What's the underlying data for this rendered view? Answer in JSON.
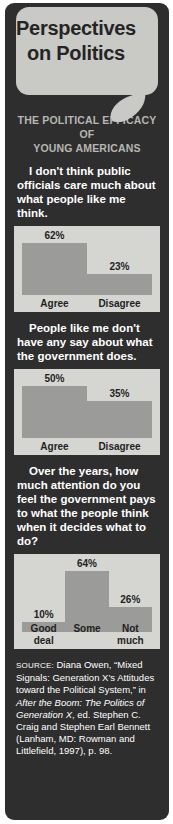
{
  "header": {
    "title_line1": "Perspectives",
    "title_line2": "on Politics",
    "bubble_color": "#c9c9c6",
    "background_color": "#2e2e2e"
  },
  "subtitle": {
    "line1": "THE POLITICAL EFFICACY OF",
    "line2": "YOUNG AMERICANS",
    "color": "#b6b6b2"
  },
  "chart_data": [
    {
      "type": "bar",
      "title": "I don't think public officials care much about what people like me think.",
      "categories": [
        "Agree",
        "Disagree"
      ],
      "values": [
        62,
        23
      ],
      "value_labels": [
        "62%",
        "23%"
      ],
      "ylim": [
        0,
        100
      ],
      "xlabel": "",
      "ylabel": "",
      "bar_color": "#9b9b99",
      "panel_color": "#d5d5d2"
    },
    {
      "type": "bar",
      "title": "People like me don't have any say about what the government does.",
      "categories": [
        "Agree",
        "Disagree"
      ],
      "values": [
        50,
        35
      ],
      "value_labels": [
        "50%",
        "35%"
      ],
      "ylim": [
        0,
        100
      ],
      "xlabel": "",
      "ylabel": "",
      "bar_color": "#9b9b99",
      "panel_color": "#d5d5d2"
    },
    {
      "type": "bar",
      "title": "Over the years, how much attention do you feel the government pays to what the people think when it decides what to do?",
      "categories": [
        "Good deal",
        "Some",
        "Not much"
      ],
      "values": [
        10,
        64,
        26
      ],
      "value_labels": [
        "10%",
        "64%",
        "26%"
      ],
      "ylim": [
        0,
        100
      ],
      "xlabel": "",
      "ylabel": "",
      "bar_color": "#9b9b99",
      "panel_color": "#d5d5d2"
    }
  ],
  "source": {
    "label": "SOURCE:",
    "part1": " Diana Owen, “Mixed Signals: Generation X’s Attitudes toward the Political System,” in ",
    "italic1": "After the Boom: The Politics of Generation X",
    "part2": ", ed. Stephen C. Craig and Stephen Earl Bennett (Lanham, MD: Rowman and Littlefield, 1997), p. 98."
  }
}
